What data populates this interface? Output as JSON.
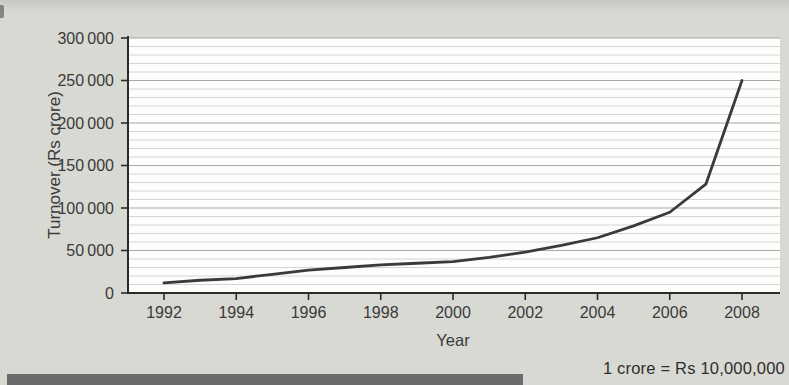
{
  "chart_data": {
    "type": "line",
    "title": "",
    "xlabel": "Year",
    "ylabel": "Turnover (Rs crore)",
    "x": [
      1992,
      1993,
      1994,
      1995,
      1996,
      1997,
      1998,
      1999,
      2000,
      2001,
      2002,
      2003,
      2004,
      2005,
      2006,
      2007,
      2008
    ],
    "values": [
      12000,
      15000,
      17000,
      22000,
      27000,
      30000,
      33000,
      35000,
      37000,
      42000,
      48000,
      56000,
      65000,
      79000,
      95000,
      128000,
      250000
    ],
    "series_name": "Turnover",
    "xticks": [
      "1992",
      "1994",
      "1996",
      "1998",
      "2000",
      "2002",
      "2004",
      "2006",
      "2008"
    ],
    "yticks": [
      0,
      50000,
      100000,
      150000,
      200000,
      250000,
      300000
    ],
    "ytick_labels": [
      "0",
      "50 000",
      "100 000",
      "150 000",
      "200 000",
      "250 000",
      "300 000"
    ],
    "ylim": [
      0,
      300000
    ],
    "xlim": [
      1991,
      2009
    ],
    "grid": "horizontal",
    "minor_grid_step": 10000,
    "legend": "none",
    "colors": {
      "line": "#3a3a3a",
      "axis": "#2b2b2b",
      "major_grid": "#a9a9a9",
      "minor_grid": "#d4d4d4",
      "plot_bg": "#fdfdfc",
      "page_bg": "#d8d9d3",
      "label": "#3a3a3a"
    }
  },
  "footnote": "1 crore = Rs 10,000,000",
  "decorations": {
    "bottom_bar_color": "#6b6b6b"
  }
}
